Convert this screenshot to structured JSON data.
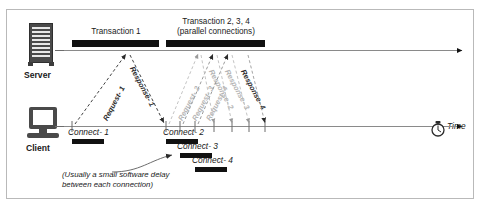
{
  "figure": {
    "background": "#ffffff",
    "border_color": "#b9b9b9"
  },
  "nodes": [
    {
      "id": "server",
      "label": "Server",
      "icon": "server-tower-icon"
    },
    {
      "id": "client",
      "label": "Client",
      "icon": "computer-monitor-icon"
    }
  ],
  "transactions": [
    {
      "id": "txn1",
      "title_line1": "Transaction 1",
      "title_line2": "",
      "bar_left": 72,
      "bar_width": 87
    },
    {
      "id": "txn234",
      "title_line1": "Transaction 2, 3, 4",
      "title_line2": "(parallel connections)",
      "bar_left": 166,
      "bar_width": 99
    }
  ],
  "connections": [
    {
      "label": "Connect- 1",
      "text_x": 68,
      "text_y": 128,
      "bar_x": 72,
      "bar_y": 139,
      "bar_w": 32
    },
    {
      "label": "Connect- 2",
      "text_x": 163,
      "text_y": 128,
      "bar_x": 166,
      "bar_y": 139,
      "bar_w": 32
    },
    {
      "label": "Connect- 3",
      "text_x": 177,
      "text_y": 142,
      "bar_x": 180,
      "bar_y": 153,
      "bar_w": 32
    },
    {
      "label": "Connect- 4",
      "text_x": 192,
      "text_y": 156,
      "bar_x": 195,
      "bar_y": 167,
      "bar_w": 32
    }
  ],
  "message_labels": [
    {
      "text": "Request- 1",
      "x": 101,
      "y": 118,
      "rotation": -62,
      "faint": false
    },
    {
      "text": "Response- 1",
      "x": 136,
      "y": 65,
      "rotation": 62,
      "faint": false
    },
    {
      "text": "Request- 2",
      "x": 176,
      "y": 118,
      "rotation": -62,
      "faint": true
    },
    {
      "text": "Request- 3",
      "x": 190,
      "y": 118,
      "rotation": -62,
      "faint": true
    },
    {
      "text": "Request- 4",
      "x": 204,
      "y": 118,
      "rotation": -62,
      "faint": true
    },
    {
      "text": "Response- 2",
      "x": 215,
      "y": 68,
      "rotation": 62,
      "faint": true
    },
    {
      "text": "Response- 3",
      "x": 231,
      "y": 68,
      "rotation": 62,
      "faint": true
    },
    {
      "text": "Response- 4",
      "x": 247,
      "y": 68,
      "rotation": 62,
      "faint": false
    }
  ],
  "note": {
    "line1": "(Usually a small software delay",
    "line2": "between each connection)",
    "x": 62,
    "y": 170
  },
  "axis": {
    "time_label": "Time",
    "clock_icon": "stopwatch-icon",
    "server_axis_y": 50,
    "client_axis_y": 126,
    "axis_start_x": 62,
    "axis_end_x": 466,
    "axis_color": "#8a8a8a"
  }
}
